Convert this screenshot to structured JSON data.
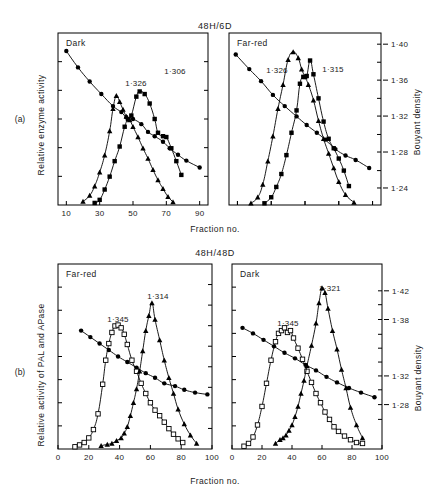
{
  "page_header": {
    "left": "",
    "right": ""
  },
  "figure": {
    "subfigure_labels": [
      "(a)",
      "(b)"
    ],
    "xlabel": "Fraction no.",
    "panel_a": {
      "title": "48H/6D",
      "ylabel_left": "Relative enzyme activity",
      "ylabel_right": "Bouyant density",
      "x_ticks": [
        "10",
        "30",
        "50",
        "70",
        "90"
      ],
      "x_tick_values": [
        10,
        30,
        50,
        70,
        90
      ],
      "xlim": [
        5,
        95
      ],
      "y_right_ticks": [
        "1·40",
        "1·36",
        "1·32",
        "1·28",
        "1·24"
      ],
      "y_right_tick_values": [
        1.4,
        1.36,
        1.32,
        1.28,
        1.24
      ],
      "left": {
        "panel_label": "Dark",
        "peak_labels": [
          "1·326",
          "1·306"
        ],
        "series": [
          {
            "name": "buoyant-density",
            "marker": "circle-filled",
            "x": [
              10,
              17,
              24,
              31,
              38,
              43,
              46,
              50,
              55,
              59,
              63,
              68,
              72,
              77,
              82,
              90
            ],
            "y": [
              0.895,
              0.8,
              0.718,
              0.645,
              0.575,
              0.54,
              0.51,
              0.5,
              0.47,
              0.425,
              0.4,
              0.368,
              0.33,
              0.292,
              0.258,
              0.218
            ]
          },
          {
            "name": "enzyme-activity-triangle",
            "marker": "triangle-filled",
            "x": [
              20,
              24,
              27,
              30,
              33,
              36,
              38,
              40,
              42,
              44,
              46,
              48,
              50,
              53,
              56,
              59,
              62,
              65,
              68,
              71,
              74
            ],
            "y": [
              0.02,
              0.055,
              0.11,
              0.19,
              0.29,
              0.43,
              0.56,
              0.635,
              0.6,
              0.555,
              0.515,
              0.495,
              0.455,
              0.395,
              0.33,
              0.27,
              0.205,
              0.145,
              0.095,
              0.048,
              0.018
            ]
          },
          {
            "name": "enzyme-activity-square",
            "marker": "square-filled",
            "x": [
              27,
              30,
              33,
              36,
              39,
              42,
              45,
              47,
              49,
              52,
              54,
              57,
              60,
              63,
              65,
              68,
              70,
              73,
              76,
              79
            ],
            "y": [
              0.012,
              0.03,
              0.09,
              0.165,
              0.255,
              0.34,
              0.455,
              0.498,
              0.52,
              0.63,
              0.66,
              0.645,
              0.59,
              0.5,
              0.42,
              0.4,
              0.395,
              0.33,
              0.255,
              0.175
            ]
          }
        ]
      },
      "right": {
        "panel_label": "Far-red",
        "peak_labels": [
          "1·326",
          "1·315"
        ],
        "series": [
          {
            "name": "buoyant-density",
            "marker": "circle-filled",
            "x": [
              9,
              17,
              24,
              31,
              38,
              45,
              51,
              57,
              62,
              68,
              74,
              80,
              88
            ],
            "y": [
              0.875,
              0.79,
              0.72,
              0.64,
              0.575,
              0.515,
              0.465,
              0.42,
              0.38,
              0.325,
              0.288,
              0.262,
              0.215
            ]
          },
          {
            "name": "enzyme-activity-triangle",
            "marker": "triangle-filled",
            "x": [
              18,
              22,
              25,
              28,
              31,
              34,
              37,
              40,
              43,
              46,
              48,
              50,
              52,
              55,
              58,
              61,
              64,
              67,
              70,
              74,
              79
            ],
            "y": [
              0.01,
              0.045,
              0.12,
              0.255,
              0.4,
              0.56,
              0.7,
              0.845,
              0.89,
              0.855,
              0.79,
              0.745,
              0.7,
              0.61,
              0.49,
              0.385,
              0.3,
              0.215,
              0.135,
              0.06,
              0.015
            ]
          },
          {
            "name": "enzyme-activity-square",
            "marker": "square-filled",
            "x": [
              26,
              30,
              33,
              36,
              39,
              42,
              45,
              47,
              49,
              51,
              53,
              55,
              58,
              61,
              64,
              67,
              70,
              73,
              76
            ],
            "y": [
              0.01,
              0.045,
              0.105,
              0.18,
              0.29,
              0.42,
              0.55,
              0.705,
              0.745,
              0.75,
              0.84,
              0.76,
              0.62,
              0.485,
              0.385,
              0.33,
              0.27,
              0.2,
              0.11
            ]
          }
        ]
      }
    },
    "panel_b": {
      "title": "48H/48D",
      "ylabel_left": "Relative activity of PAL and APase",
      "ylabel_right": "Bouyant density",
      "x_ticks": [
        "0",
        "20",
        "40",
        "60",
        "80",
        "100"
      ],
      "x_tick_values": [
        0,
        20,
        40,
        60,
        80,
        100
      ],
      "xlim": [
        0,
        100
      ],
      "y_right_ticks": [
        "1·42",
        "1·38",
        "1·32",
        "1·28"
      ],
      "y_right_tick_values": [
        1.42,
        1.38,
        1.32,
        1.28
      ],
      "left": {
        "panel_label": "Far-red",
        "peak_labels": [
          "1·345",
          "1·314"
        ],
        "series": [
          {
            "name": "buoyant-density",
            "marker": "circle-filled",
            "x": [
              15,
              21,
              27,
              33,
              39,
              45,
              51,
              57,
              63,
              69,
              76,
              82,
              89,
              97
            ],
            "y": [
              0.64,
              0.605,
              0.57,
              0.535,
              0.5,
              0.47,
              0.44,
              0.41,
              0.385,
              0.355,
              0.34,
              0.32,
              0.305,
              0.295
            ]
          },
          {
            "name": "apase-open-square",
            "marker": "square-open",
            "x": [
              11,
              14,
              17,
              20,
              23,
              26,
              29,
              31,
              33,
              35,
              37,
              39,
              41,
              43,
              45,
              48,
              51,
              54,
              57,
              60,
              63,
              66,
              69,
              72,
              75,
              78,
              81
            ],
            "y": [
              0.012,
              0.022,
              0.035,
              0.06,
              0.105,
              0.19,
              0.35,
              0.48,
              0.57,
              0.63,
              0.665,
              0.67,
              0.655,
              0.62,
              0.565,
              0.48,
              0.42,
              0.355,
              0.3,
              0.25,
              0.21,
              0.18,
              0.145,
              0.11,
              0.08,
              0.055,
              0.035
            ]
          },
          {
            "name": "pal-filled-triangle",
            "marker": "triangle-filled",
            "x": [
              28,
              32,
              35,
              38,
              41,
              43,
              45,
              47,
              49,
              51,
              53,
              55,
              57,
              59,
              61,
              63,
              66,
              69,
              72,
              75,
              78,
              82,
              86,
              90
            ],
            "y": [
              0.018,
              0.025,
              0.03,
              0.045,
              0.06,
              0.085,
              0.12,
              0.18,
              0.25,
              0.325,
              0.42,
              0.53,
              0.64,
              0.72,
              0.79,
              0.7,
              0.59,
              0.48,
              0.385,
              0.3,
              0.215,
              0.135,
              0.075,
              0.03
            ]
          }
        ]
      },
      "right": {
        "panel_label": "Dark",
        "peak_labels": [
          "1·345",
          "1·321"
        ],
        "series": [
          {
            "name": "buoyant-density",
            "marker": "circle-filled",
            "x": [
              7,
              14,
              21,
              28,
              35,
              42,
              49,
              56,
              63,
              70,
              78,
              86,
              95
            ],
            "y": [
              0.655,
              0.625,
              0.59,
              0.555,
              0.52,
              0.49,
              0.455,
              0.425,
              0.39,
              0.36,
              0.33,
              0.305,
              0.28
            ]
          },
          {
            "name": "apase-open-square",
            "marker": "square-open",
            "x": [
              8,
              11,
              14,
              17,
              20,
              23,
              26,
              29,
              31,
              33,
              35,
              37,
              39,
              41,
              44,
              47,
              50,
              53,
              56,
              59,
              62,
              65,
              68,
              71,
              75,
              79,
              83,
              87
            ],
            "y": [
              0.015,
              0.03,
              0.065,
              0.13,
              0.23,
              0.355,
              0.48,
              0.58,
              0.625,
              0.64,
              0.655,
              0.63,
              0.64,
              0.6,
              0.545,
              0.485,
              0.42,
              0.36,
              0.3,
              0.25,
              0.2,
              0.16,
              0.12,
              0.095,
              0.07,
              0.05,
              0.035,
              0.03
            ]
          },
          {
            "name": "pal-filled-triangle",
            "marker": "triangle-filled",
            "x": [
              29,
              32,
              34,
              36,
              38,
              40,
              42,
              44,
              46,
              48,
              50,
              53,
              56,
              58,
              60,
              62,
              64,
              67,
              70,
              73,
              76,
              79,
              83,
              87
            ],
            "y": [
              0.03,
              0.05,
              0.06,
              0.075,
              0.1,
              0.13,
              0.175,
              0.23,
              0.3,
              0.37,
              0.45,
              0.56,
              0.68,
              0.79,
              0.87,
              0.845,
              0.76,
              0.64,
              0.54,
              0.43,
              0.33,
              0.225,
              0.13,
              0.06
            ]
          }
        ]
      }
    }
  }
}
